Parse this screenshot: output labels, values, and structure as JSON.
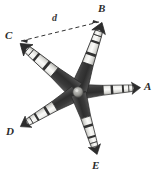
{
  "figure": {
    "background_color": "#ffffff",
    "arm_light_color": "#e8e8e6",
    "arm_dark_color": "#3f3f3f",
    "arm_mid_color": "#6f6f6f",
    "outline_color": "#2b2b2b",
    "dashed_line_color": "#333333",
    "center": {
      "x": 78,
      "y": 92
    },
    "arms": [
      {
        "id": "A",
        "label": "A",
        "tip_x": 140,
        "tip_y": 88,
        "angle_deg": -4,
        "length": 63
      },
      {
        "id": "B",
        "label": "B",
        "tip_x": 100,
        "tip_y": 20,
        "angle_deg": -71,
        "length": 75
      },
      {
        "id": "C",
        "label": "C",
        "tip_x": 20,
        "tip_y": 42,
        "angle_deg": -140,
        "length": 77
      },
      {
        "id": "D",
        "label": "D",
        "tip_x": 20,
        "tip_y": 128,
        "angle_deg": 149,
        "length": 68
      },
      {
        "id": "E",
        "label": "E",
        "tip_x": 97,
        "tip_y": 155,
        "angle_deg": 73,
        "length": 66
      }
    ],
    "dashed_segment": {
      "label": "d",
      "from": "C",
      "to": "B",
      "from_x": 21,
      "from_y": 41,
      "to_x": 99,
      "to_y": 22,
      "arrowheads": "both"
    },
    "labels": {
      "A": "A",
      "B": "B",
      "C": "C",
      "D": "D",
      "E": "E",
      "d": "d"
    }
  }
}
